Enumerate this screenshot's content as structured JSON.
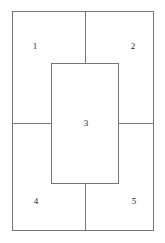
{
  "figure": {
    "type": "region-partition-diagram",
    "background_color": "#ffffff",
    "line_color": "#767676",
    "text_color": "#1d1d1d",
    "outer_frame": {
      "x": 12,
      "y": 11,
      "width": 142,
      "height": 220
    },
    "center_rect": {
      "x": 51,
      "y": 63,
      "width": 68,
      "height": 121
    },
    "dividers": [
      {
        "name": "top-vertical",
        "orientation": "vertical",
        "x": 85,
        "y1": 11,
        "y2": 64
      },
      {
        "name": "bottom-vertical",
        "orientation": "vertical",
        "x": 85,
        "y1": 183,
        "y2": 231
      },
      {
        "name": "left-horizontal",
        "orientation": "horizontal",
        "y": 123,
        "x1": 12,
        "x2": 52
      },
      {
        "name": "right-horizontal",
        "orientation": "horizontal",
        "y": 123,
        "x1": 118,
        "x2": 154
      }
    ],
    "regions": [
      {
        "id": "1",
        "label": "1",
        "position": "top-left",
        "cx": 35,
        "cy": 47
      },
      {
        "id": "2",
        "label": "2",
        "position": "top-right",
        "cx": 133,
        "cy": 47
      },
      {
        "id": "3",
        "label": "3",
        "position": "center",
        "cx": 86,
        "cy": 124
      },
      {
        "id": "4",
        "label": "4",
        "position": "bottom-left",
        "cx": 36,
        "cy": 202
      },
      {
        "id": "5",
        "label": "5",
        "position": "bottom-right",
        "cx": 134,
        "cy": 202
      }
    ]
  }
}
